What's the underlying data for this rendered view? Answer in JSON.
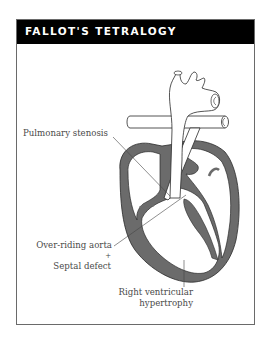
{
  "header": {
    "title": "FALLOT'S TETRALOGY"
  },
  "labels": {
    "pulmonary_stenosis": "Pulmonary stenosis",
    "overriding_aorta": "Over-riding aorta",
    "plus": "+",
    "septal_defect": "Septal defect",
    "rv_hypertrophy_line1": "Right ventricular",
    "rv_hypertrophy_line2": "hypertrophy"
  },
  "colors": {
    "header_bg": "#000000",
    "header_text": "#ffffff",
    "myocardium": "#6b6b6b",
    "outline": "#333333"
  }
}
